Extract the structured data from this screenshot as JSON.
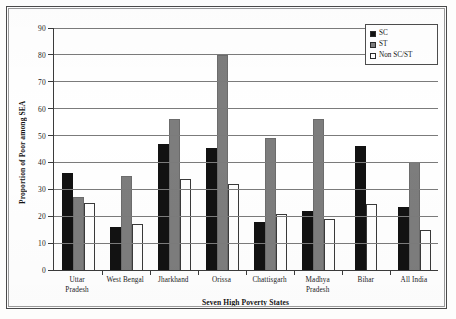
{
  "chart_data": {
    "type": "bar",
    "title": "",
    "xlabel": "Seven High Poverty States",
    "ylabel": "Proportion of Poor among SEA",
    "ylim": [
      0,
      90
    ],
    "yticks": [
      0,
      10,
      20,
      30,
      40,
      50,
      60,
      70,
      80,
      90
    ],
    "grid": true,
    "legend_position": "top-right",
    "categories": [
      "Uttar Pradesh",
      "West Bengal",
      "Jharkhand",
      "Orissa",
      "Chattisgarh",
      "Madhya Pradesh",
      "Bihar",
      "All India"
    ],
    "category_lines": [
      [
        "Uttar",
        "Pradesh"
      ],
      [
        "West Bengal"
      ],
      [
        "Jharkhand"
      ],
      [
        "Orissa"
      ],
      [
        "Chattisgarh"
      ],
      [
        "Madhya",
        "Pradesh"
      ],
      [
        "Bihar"
      ],
      [
        "All India"
      ]
    ],
    "series": [
      {
        "name": "SC",
        "color": "#121212",
        "values": [
          36,
          16,
          47,
          45.5,
          18,
          22,
          46,
          23.5
        ]
      },
      {
        "name": "ST",
        "color": "#7d7d7d",
        "values": [
          27,
          35,
          56,
          80,
          49,
          56,
          0,
          40
        ]
      },
      {
        "name": "Non SC/ST",
        "color": "#ffffff",
        "values": [
          25,
          17,
          34,
          32,
          21,
          19,
          24.5,
          15
        ]
      }
    ]
  },
  "legend": {
    "items": [
      {
        "label": "SC"
      },
      {
        "label": "ST"
      },
      {
        "label": "Non SC/ST"
      }
    ]
  },
  "axes": {
    "y_title": "Proportion of Poor among SEA",
    "x_title": "Seven High Poverty States",
    "y_tick_labels": [
      "90",
      "80",
      "70",
      "60",
      "50",
      "40",
      "30",
      "20",
      "10",
      "0"
    ]
  }
}
